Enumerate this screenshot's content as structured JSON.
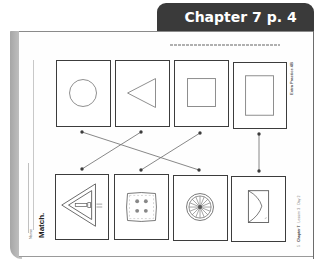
{
  "header": {
    "chapter_tab": "Chapter 7  p. 4"
  },
  "page": {
    "directions": "Directions: Match each shape to the object that has the same shape.",
    "side_label": "Extra Practice 4B",
    "footer": {
      "chapter": "Chapter 7",
      "lesson": "Lesson 3",
      "day": "Day 2",
      "page_number": "5"
    },
    "name_label": "Name",
    "instruction": "Match."
  },
  "shapes_row": [
    {
      "id": "circle",
      "label": "circle"
    },
    {
      "id": "triangle",
      "label": "triangle"
    },
    {
      "id": "square",
      "label": "square"
    },
    {
      "id": "rectangle",
      "label": "rectangle"
    }
  ],
  "objects_row": [
    {
      "id": "yield-sign",
      "label": "triangular sign"
    },
    {
      "id": "napkin",
      "label": "square napkin"
    },
    {
      "id": "wheel",
      "label": "round wheel"
    },
    {
      "id": "envelope",
      "label": "rectangular envelope"
    }
  ],
  "matches": [
    {
      "from": "circle",
      "to": "wheel"
    },
    {
      "from": "triangle",
      "to": "yield-sign"
    },
    {
      "from": "square",
      "to": "napkin"
    },
    {
      "from": "rectangle",
      "to": "envelope"
    }
  ],
  "colors": {
    "tab_background": "#3a3a3a",
    "tab_text": "#ffffff",
    "card_border": "#3c3c3c",
    "line": "#7a7a7a"
  }
}
